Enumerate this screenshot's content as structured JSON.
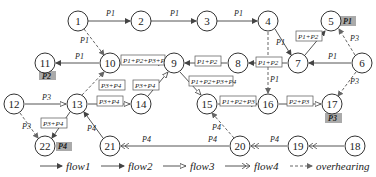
{
  "nodes": [
    {
      "id": "1",
      "x": 78,
      "y": 21
    },
    {
      "id": "2",
      "x": 141,
      "y": 21
    },
    {
      "id": "3",
      "x": 207,
      "y": 21
    },
    {
      "id": "4",
      "x": 268,
      "y": 21
    },
    {
      "id": "5",
      "x": 331,
      "y": 21
    },
    {
      "id": "6",
      "x": 362,
      "y": 63
    },
    {
      "id": "7",
      "x": 298,
      "y": 63
    },
    {
      "id": "8",
      "x": 238,
      "y": 63
    },
    {
      "id": "9",
      "x": 174,
      "y": 63
    },
    {
      "id": "10",
      "x": 110,
      "y": 63
    },
    {
      "id": "11",
      "x": 45,
      "y": 63
    },
    {
      "id": "12",
      "x": 14,
      "y": 104
    },
    {
      "id": "13",
      "x": 77,
      "y": 104
    },
    {
      "id": "14",
      "x": 141,
      "y": 104
    },
    {
      "id": "15",
      "x": 207,
      "y": 104
    },
    {
      "id": "16",
      "x": 268,
      "y": 104
    },
    {
      "id": "17",
      "x": 332,
      "y": 104
    },
    {
      "id": "18",
      "x": 355,
      "y": 146
    },
    {
      "id": "19",
      "x": 298,
      "y": 146
    },
    {
      "id": "20",
      "x": 240,
      "y": 146
    },
    {
      "id": "21",
      "x": 110,
      "y": 146
    },
    {
      "id": "22",
      "x": 45,
      "y": 146
    }
  ],
  "edge_labels": {
    "e1_2": "P1",
    "e2_3": "P1",
    "e3_4": "P1",
    "e4_7": "P1",
    "e1_10": "P1",
    "e10_11": "P1",
    "e6_7": "P1",
    "e7_5": "P1+P2",
    "e7_8": "P1+P2",
    "e8_9": "P1+P2",
    "e10_9": "P1+P2+P3+P4",
    "e9_15": "P1+P2+P3+P4",
    "e14_9": "P3+P4",
    "e13_10": "P3+P4",
    "e13_14": "P3+P4",
    "e13_22": "P3+P4",
    "e15_16": "P1+P2+P3",
    "e16_17": "P2+P3",
    "e12_13": "P3",
    "e12_22": "P3",
    "e6_17": "P3",
    "e4_16": "P1",
    "e6_5": "P3",
    "e21_13": "P4",
    "e20_21": "P4",
    "e19_20": "P4",
    "e18_19": "P4",
    "e20_15": "P4"
  },
  "node_tags": {
    "5": "P1",
    "11": "P2",
    "17": "P3",
    "22": "P4"
  },
  "legend": {
    "flow1": "flow1",
    "flow2": "flow2",
    "flow3": "flow3",
    "flow4": "flow4",
    "overhearing": "overhearing"
  }
}
